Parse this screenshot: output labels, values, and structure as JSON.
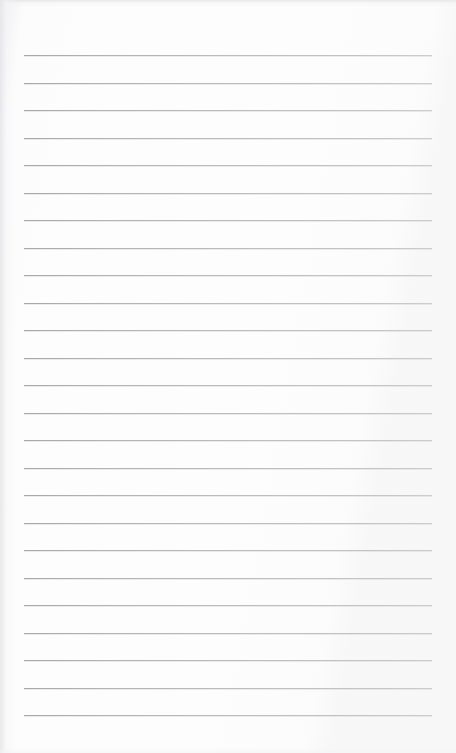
{
  "document": {
    "kind": "lined-notepad-page",
    "title": "Blank ruled notepad page",
    "content_text": "",
    "page_width": 456,
    "page_height": 753,
    "background_color": "#fdfdfd",
    "paper_tint_color": "#f4f4f6"
  },
  "ruling": {
    "line_count": 25,
    "line_color": "#b8b8bb",
    "line_thickness": 1,
    "first_line_y": 55,
    "line_spacing": 27.5,
    "line_start_x": 24,
    "line_end_x": 432,
    "top_margin": 55,
    "bottom_margin": 55,
    "left_margin": 24,
    "right_margin": 24
  },
  "scan_artifacts": {
    "top_edge_color": "#e4e4e6",
    "left_edge_color": "#e6e6e9",
    "bottom_edge_color": "#f3f3f5"
  }
}
